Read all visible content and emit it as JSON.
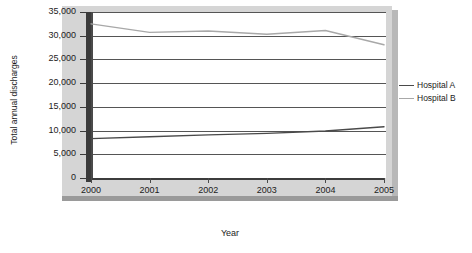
{
  "chart_data": {
    "type": "line",
    "title": "",
    "xlabel": "Year",
    "ylabel": "Total annual discharges",
    "categories": [
      "2000",
      "2001",
      "2002",
      "2003",
      "2004",
      "2005"
    ],
    "x": [
      2000,
      2001,
      2002,
      2003,
      2004,
      2005
    ],
    "series": [
      {
        "name": "Hospital A",
        "color": "#4a4a4a",
        "values": [
          8300,
          8700,
          9100,
          9400,
          9900,
          10800
        ]
      },
      {
        "name": "Hospital B",
        "color": "#a8a8a8",
        "values": [
          32500,
          30700,
          31000,
          30300,
          31100,
          28100
        ]
      }
    ],
    "ylim": [
      0,
      35000
    ],
    "yticks": [
      0,
      5000,
      10000,
      15000,
      20000,
      25000,
      30000,
      35000
    ],
    "ytick_labels": [
      "0",
      "5,000",
      "10,000",
      "15,000",
      "20,000",
      "25,000",
      "30,000",
      "35,000"
    ],
    "xlim": [
      2000,
      2005
    ],
    "grid": true,
    "grid_axis": "y",
    "legend_position": "right"
  },
  "legend": {
    "entries": [
      {
        "label": "Hospital A",
        "color": "#4a4a4a"
      },
      {
        "label": "Hospital B",
        "color": "#a8a8a8"
      }
    ]
  },
  "axis_titles": {
    "x": "Year",
    "y": "Total annual discharges"
  }
}
